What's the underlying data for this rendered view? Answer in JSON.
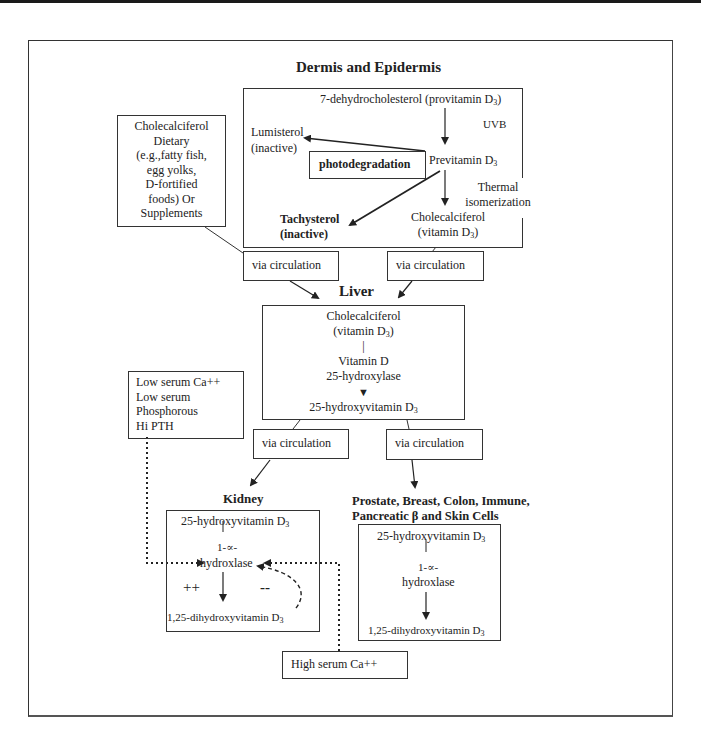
{
  "diagram": {
    "dermis": {
      "title": "Dermis and Epidermis",
      "provitamin": "7-dehydrocholesterol (provitamin D",
      "provitamin_sub": "3",
      "provitamin_close": ")",
      "uvb": "UVB",
      "lumisterol_1": "Lumisterol",
      "lumisterol_2": "(inactive)",
      "photodegradation": "photodegradation",
      "previtamin": "Previtamin D",
      "previtamin_sub": "3",
      "thermal_1": "Thermal",
      "thermal_2": "isomerization",
      "tachysterol_1": "Tachysterol",
      "tachysterol_2": "(inactive)",
      "cholecalciferol_1": "Cholecalciferol",
      "cholecalciferol_2": "(vitamin D",
      "cholecalciferol_sub": "3",
      "cholecalciferol_close": ")"
    },
    "dietary": {
      "lines": [
        "Cholecalciferol",
        "Dietary",
        "(e.g.,fatty fish,",
        "egg yolks,",
        "D-fortified",
        "foods) Or",
        "Supplements"
      ]
    },
    "circulation_label": "via circulation",
    "liver": {
      "title": "Liver",
      "line1": "Cholecalciferol",
      "line2": "(vitamin D",
      "line2_sub": "3",
      "line2_close": ")",
      "bar": "|",
      "enzyme_1": "Vitamin  D",
      "enzyme_2": "25-hydroxylase",
      "product": "25-hydroxyvitamin D",
      "product_sub": "3"
    },
    "low_serum": {
      "lines": [
        "Low serum Ca++",
        "Low serum",
        "Phosphorous",
        "Hi PTH"
      ]
    },
    "kidney": {
      "title": "Kidney",
      "substrate": "25-hydroxyvitamin D",
      "substrate_sub": "3",
      "bar": "|",
      "enzyme_1": "1-∝-",
      "enzyme_2": "hydroxlase",
      "plus": "++",
      "minus": "--",
      "product": "1,25-dihydroxyvitamin D",
      "product_sub": "3"
    },
    "high_serum": {
      "label": "High serum Ca++"
    },
    "tissues": {
      "title_1": "Prostate, Breast, Colon, Immune,",
      "title_2": "Pancreatic β and Skin Cells",
      "substrate": "25-hydroxyvitamin D",
      "substrate_sub": "3",
      "bar": "|",
      "enzyme_1": "1-∝-",
      "enzyme_2": "hydroxlase",
      "product": "1,25-dihydroxyvitamin D",
      "product_sub": "3"
    },
    "colors": {
      "line": "#222222",
      "text": "#222222",
      "background": "#ffffff"
    }
  }
}
